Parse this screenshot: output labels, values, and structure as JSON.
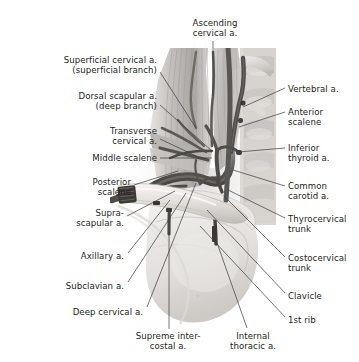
{
  "figure": {
    "kind": "anatomical-illustration",
    "style": "grayscale halftone medical illustration",
    "palette": {
      "background": "#ffffff",
      "text": "#231f20",
      "leader_line": "#3a3a3c",
      "muscle_light": "#d8d6d4",
      "muscle_mid": "#b9b6b4",
      "muscle_dark": "#8d8a88",
      "bone_light": "#eae7e4",
      "bone_mid": "#cfcbc7",
      "vessel_dark": "#4a4745",
      "vessel_mid": "#6f6c6a",
      "vein_dark": "#3c3a39",
      "shadow": "#a09d9b"
    }
  },
  "labels": {
    "top": [
      {
        "id": "ascending-cervical",
        "text": "Ascending\ncervical a.",
        "align": "center",
        "x": 172,
        "y": 18,
        "width": 86,
        "leader": [
          [
            213,
            41
          ],
          [
            213,
            96
          ]
        ]
      }
    ],
    "left": [
      {
        "id": "superficial-cervical",
        "text": "Superficial cervical a.\n(superficial branch)",
        "align": "right",
        "x": 12,
        "y": 55,
        "width": 145,
        "leader": [
          [
            160,
            72
          ],
          [
            196,
            128
          ]
        ]
      },
      {
        "id": "dorsal-scapular",
        "text": "Dorsal scapular a.\n(deep branch)",
        "align": "right",
        "x": 16,
        "y": 91,
        "width": 141,
        "leader": [
          [
            160,
            105
          ],
          [
            212,
            151
          ]
        ]
      },
      {
        "id": "transverse-cervical",
        "text": "Transverse\ncervical a.",
        "align": "right",
        "x": 38,
        "y": 126,
        "width": 119,
        "leader": [
          [
            160,
            139
          ],
          [
            196,
            156
          ]
        ]
      },
      {
        "id": "middle-scalene",
        "text": "Middle scalene",
        "align": "right",
        "x": 26,
        "y": 153,
        "width": 131,
        "leader": [
          [
            160,
            158
          ],
          [
            212,
            158
          ]
        ]
      },
      {
        "id": "posterior-scalene",
        "text": "Posterior\nscalene",
        "align": "right",
        "x": 22,
        "y": 177,
        "width": 109,
        "leader": [
          [
            134,
            185
          ],
          [
            178,
            171
          ]
        ]
      },
      {
        "id": "suprascapular",
        "text": "Supra-\nscapular a.",
        "align": "right",
        "x": 14,
        "y": 208,
        "width": 110,
        "leader": [
          [
            127,
            216
          ],
          [
            175,
            191
          ]
        ]
      },
      {
        "id": "axillary",
        "text": "Axillary a.",
        "align": "right",
        "x": 22,
        "y": 251,
        "width": 102,
        "leader": [
          [
            128,
            253
          ],
          [
            170,
            200
          ]
        ]
      },
      {
        "id": "subclavian",
        "text": "Subclavian a.",
        "align": "right",
        "x": 22,
        "y": 281,
        "width": 102,
        "leader": [
          [
            128,
            282
          ],
          [
            186,
            193
          ]
        ]
      },
      {
        "id": "deep-cervical",
        "text": "Deep cervical a.",
        "align": "right",
        "x": 26,
        "y": 307,
        "width": 117,
        "leader": [
          [
            147,
            307
          ],
          [
            196,
            183
          ]
        ]
      }
    ],
    "right": [
      {
        "id": "vertebral",
        "text": "Vertebral a.",
        "align": "left",
        "x": 288,
        "y": 84,
        "width": 70,
        "leader": [
          [
            285,
            88
          ],
          [
            243,
            107
          ]
        ]
      },
      {
        "id": "anterior-scalene",
        "text": "Anterior\nscalene",
        "align": "left",
        "x": 288,
        "y": 107,
        "width": 70,
        "leader": [
          [
            285,
            112
          ],
          [
            239,
            127
          ]
        ]
      },
      {
        "id": "inferior-thyroid",
        "text": "Inferior\nthyroid a.",
        "align": "left",
        "x": 288,
        "y": 143,
        "width": 70,
        "leader": [
          [
            285,
            148
          ],
          [
            238,
            152
          ]
        ]
      },
      {
        "id": "common-carotid",
        "text": "Common\ncarotid a.",
        "align": "left",
        "x": 288,
        "y": 181,
        "width": 70,
        "leader": [
          [
            285,
            186
          ],
          [
            233,
            170
          ]
        ]
      },
      {
        "id": "thyrocervical-trunk",
        "text": "Thyrocervical\ntrunk",
        "align": "left",
        "x": 288,
        "y": 214,
        "width": 71,
        "leader": [
          [
            285,
            218
          ],
          [
            228,
            190
          ]
        ]
      },
      {
        "id": "costocervical-trunk",
        "text": "Costocervical\ntrunk",
        "align": "left",
        "x": 288,
        "y": 253,
        "width": 71,
        "leader": [
          [
            285,
            257
          ],
          [
            224,
            196
          ]
        ]
      },
      {
        "id": "clavicle",
        "text": "Clavicle",
        "align": "left",
        "x": 288,
        "y": 291,
        "width": 70,
        "leader": [
          [
            285,
            293
          ],
          [
            207,
            210
          ]
        ]
      },
      {
        "id": "first-rib",
        "text": "1st rib",
        "align": "left",
        "x": 288,
        "y": 315,
        "width": 70,
        "leader": [
          [
            285,
            317
          ],
          [
            200,
            226
          ]
        ]
      }
    ],
    "bottom": [
      {
        "id": "supreme-intercostal",
        "text": "Supreme inter-\ncostal a.",
        "align": "center",
        "x": 126,
        "y": 331,
        "width": 84,
        "leader": [
          [
            169,
            329
          ],
          [
            169,
            232
          ]
        ]
      },
      {
        "id": "internal-thoracic",
        "text": "Internal\nthoracic a.",
        "align": "center",
        "x": 216,
        "y": 331,
        "width": 74,
        "leader": [
          [
            247,
            328
          ],
          [
            216,
            240
          ]
        ]
      }
    ]
  }
}
